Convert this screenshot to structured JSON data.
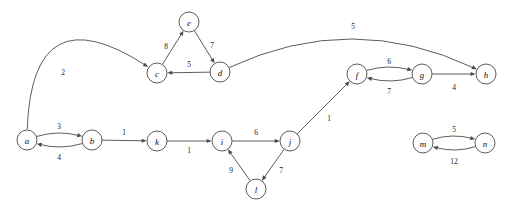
{
  "figure": {
    "kind": "directed-weighted-graph",
    "background_color": "#ffffff",
    "stroke_color": "#4a4a4a",
    "label_color": "#111111",
    "width": 506,
    "height": 217
  },
  "graph_data": {
    "type": "graph",
    "directed": true,
    "weighted": true,
    "node_count": 14,
    "edge_count": 17,
    "nodes": [
      {
        "id": "a",
        "label": "a",
        "x": 27,
        "y": 140,
        "r": 10
      },
      {
        "id": "b",
        "label": "b",
        "x": 92,
        "y": 140,
        "r": 10
      },
      {
        "id": "c",
        "label": "c",
        "x": 157,
        "y": 73,
        "r": 10
      },
      {
        "id": "d",
        "label": "d",
        "x": 220,
        "y": 72,
        "r": 10
      },
      {
        "id": "e",
        "label": "e",
        "x": 189,
        "y": 22,
        "r": 10
      },
      {
        "id": "f",
        "label": "f",
        "x": 357,
        "y": 74,
        "r": 10
      },
      {
        "id": "g",
        "label": "g",
        "x": 422,
        "y": 74,
        "r": 10
      },
      {
        "id": "h",
        "label": "h",
        "x": 486,
        "y": 74,
        "r": 10
      },
      {
        "id": "i",
        "label": "i",
        "x": 222,
        "y": 141,
        "r": 10
      },
      {
        "id": "j",
        "label": "j",
        "x": 290,
        "y": 141,
        "r": 10
      },
      {
        "id": "k",
        "label": "k",
        "x": 157,
        "y": 141,
        "r": 10
      },
      {
        "id": "l",
        "label": "l",
        "x": 256,
        "y": 189,
        "r": 10
      },
      {
        "id": "m",
        "label": "m",
        "x": 423,
        "y": 143,
        "r": 10
      },
      {
        "id": "n",
        "label": "n",
        "x": 485,
        "y": 143,
        "r": 10
      }
    ],
    "edges": [
      {
        "id": "a-c",
        "from": "a",
        "to": "c",
        "weight": 2,
        "label_x": 63,
        "label_y": 72,
        "curve": -70
      },
      {
        "id": "a-b",
        "from": "a",
        "to": "b",
        "weight": 3,
        "label_x": 59,
        "label_y": 126,
        "curve": -7
      },
      {
        "id": "b-a",
        "from": "b",
        "to": "a",
        "weight": 4,
        "label_x": 59,
        "label_y": 157,
        "curve": -7
      },
      {
        "id": "c-e",
        "from": "c",
        "to": "e",
        "weight": 8,
        "label_x": 166,
        "label_y": 46,
        "curve": 0
      },
      {
        "id": "e-d",
        "from": "e",
        "to": "d",
        "weight": 7,
        "label_x": 212,
        "label_y": 45,
        "curve": 0
      },
      {
        "id": "d-c",
        "from": "d",
        "to": "c",
        "weight": 5,
        "label_x": 189,
        "label_y": 64,
        "curve": 0
      },
      {
        "id": "d-h",
        "from": "d",
        "to": "h",
        "weight": 5,
        "label_x": 353,
        "label_y": 26,
        "curve": -34
      },
      {
        "id": "b-k",
        "from": "b",
        "to": "k",
        "weight": 1,
        "label_x": 124,
        "label_y": 132,
        "curve": 0
      },
      {
        "id": "k-i",
        "from": "k",
        "to": "i",
        "weight": 1,
        "label_x": 189,
        "label_y": 150,
        "curve": 0
      },
      {
        "id": "i-j",
        "from": "i",
        "to": "j",
        "weight": 6,
        "label_x": 256,
        "label_y": 132,
        "curve": 0
      },
      {
        "id": "j-l",
        "from": "j",
        "to": "l",
        "weight": 7,
        "label_x": 281,
        "label_y": 170,
        "curve": 0
      },
      {
        "id": "l-i",
        "from": "l",
        "to": "i",
        "weight": 9,
        "label_x": 231,
        "label_y": 170,
        "curve": 0
      },
      {
        "id": "j-f",
        "from": "j",
        "to": "f",
        "weight": 1,
        "label_x": 329,
        "label_y": 118,
        "curve": 0
      },
      {
        "id": "f-g",
        "from": "f",
        "to": "g",
        "weight": 6,
        "label_x": 389,
        "label_y": 61,
        "curve": -7
      },
      {
        "id": "g-f",
        "from": "g",
        "to": "f",
        "weight": 7,
        "label_x": 389,
        "label_y": 91,
        "curve": -7
      },
      {
        "id": "g-h",
        "from": "g",
        "to": "h",
        "weight": 4,
        "label_x": 454,
        "label_y": 87,
        "curve": 0
      },
      {
        "id": "m-n",
        "from": "m",
        "to": "n",
        "weight": 5,
        "label_x": 454,
        "label_y": 129,
        "curve": -7
      },
      {
        "id": "n-m",
        "from": "n",
        "to": "m",
        "weight": 12,
        "label_x": 454,
        "label_y": 161,
        "curve": -7
      }
    ]
  }
}
